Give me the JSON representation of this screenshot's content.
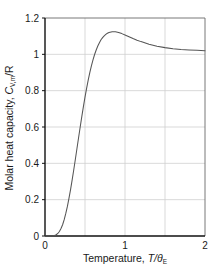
{
  "figure": {
    "background_color": "#ffffff",
    "curve_color": "#555555",
    "grid_color": "#cfcfcf",
    "axis_color": "#111111"
  },
  "chart_data": {
    "type": "line",
    "title": "",
    "subtitle": "",
    "xlabel": "Temperature, T/θ",
    "xlabel_plain": "Temperature, T/θE",
    "xlabel_main": "Temperature, ",
    "xlabel_var": "T/θ",
    "xlabel_sub": "E",
    "ylabel": "Molar heat capacity, C",
    "ylabel_plain": "Molar heat capacity, CV,m/R",
    "ylabel_main": "Molar heat capacity, ",
    "ylabel_var": "C",
    "ylabel_sub": "V,m",
    "ylabel_tail": "/R",
    "xlim": [
      0,
      2
    ],
    "ylim": [
      0,
      1.2
    ],
    "grid": true,
    "legend": false,
    "legend_position": "none",
    "x_ticks_labeled": [
      "0",
      "1",
      "2"
    ],
    "x_tick_values": [
      0,
      1,
      2
    ],
    "x_gridline_values": [
      0.5,
      1,
      1.5
    ],
    "y_ticks_labeled": [
      "0",
      "0.2",
      "0.4",
      "0.6",
      "0.8",
      "1",
      "1.2"
    ],
    "y_tick_values": [
      0,
      0.2,
      0.4,
      0.6,
      0.8,
      1.0,
      1.2
    ],
    "y_gridline_values": [
      0.2,
      0.4,
      0.6,
      0.8,
      1.0
    ],
    "series": [
      {
        "name": "Einstein molar heat capacity",
        "x": [
          0.0,
          0.05,
          0.1,
          0.12,
          0.14,
          0.16,
          0.18,
          0.2,
          0.22,
          0.24,
          0.26,
          0.28,
          0.3,
          0.32,
          0.34,
          0.36,
          0.38,
          0.4,
          0.42,
          0.44,
          0.46,
          0.48,
          0.5,
          0.52,
          0.54,
          0.56,
          0.58,
          0.6,
          0.62,
          0.64,
          0.66,
          0.68,
          0.7,
          0.72,
          0.74,
          0.76,
          0.78,
          0.8,
          0.84,
          0.88,
          0.92,
          0.96,
          1.0,
          1.05,
          1.1,
          1.15,
          1.2,
          1.3,
          1.4,
          1.5,
          1.6,
          1.7,
          1.8,
          1.9,
          2.0
        ],
        "y": [
          0.0,
          0.0,
          0.001,
          0.003,
          0.007,
          0.014,
          0.025,
          0.041,
          0.062,
          0.09,
          0.124,
          0.163,
          0.208,
          0.257,
          0.31,
          0.366,
          0.424,
          0.483,
          0.542,
          0.6,
          0.657,
          0.712,
          0.764,
          0.813,
          0.858,
          0.899,
          0.937,
          0.97,
          0.999,
          1.024,
          1.046,
          1.064,
          1.08,
          1.092,
          1.102,
          1.11,
          1.116,
          1.12,
          1.124,
          1.124,
          1.12,
          1.114,
          1.107,
          1.097,
          1.087,
          1.078,
          1.07,
          1.056,
          1.045,
          1.037,
          1.031,
          1.027,
          1.024,
          1.022,
          1.02
        ],
        "color": "#555555",
        "style": "solid"
      }
    ],
    "annotations": [],
    "notes": {
      "peak_value": 1.124,
      "peak_x": 0.8,
      "asymptote": 1.0,
      "value_at_xmax": 1.02
    }
  }
}
